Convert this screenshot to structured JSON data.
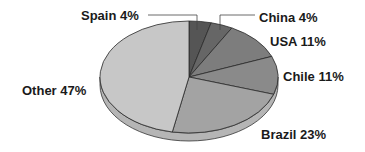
{
  "chart_data": {
    "type": "pie",
    "title": "",
    "style": "3d-grayscale",
    "slices": [
      {
        "label": "Spain",
        "value": 4,
        "display": "Spain 4%",
        "color": "#555555"
      },
      {
        "label": "China",
        "value": 4,
        "display": "China 4%",
        "color": "#666666"
      },
      {
        "label": "USA",
        "value": 11,
        "display": "USA 11%",
        "color": "#7d7d7d"
      },
      {
        "label": "Chile",
        "value": 11,
        "display": "Chile 11%",
        "color": "#8a8a8a"
      },
      {
        "label": "Brazil",
        "value": 23,
        "display": "Brazil 23%",
        "color": "#a3a3a3"
      },
      {
        "label": "Other",
        "value": 47,
        "display": "Other 47%",
        "color": "#c7c7c7"
      }
    ],
    "categories": [
      "Spain",
      "China",
      "USA",
      "Chile",
      "Brazil",
      "Other"
    ],
    "values": [
      4,
      4,
      11,
      11,
      23,
      47
    ],
    "unit": "%"
  }
}
